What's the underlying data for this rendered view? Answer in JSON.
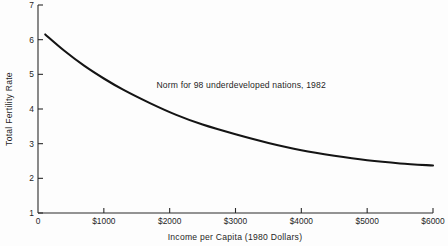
{
  "chart_data": {
    "type": "line",
    "title": "",
    "xlabel": "Income per Capita (1980 Dollars)",
    "ylabel": "Total Fertility Rate",
    "xlim": [
      0,
      6000
    ],
    "ylim": [
      1,
      7
    ],
    "grid": false,
    "legend": "none",
    "annotations": [
      {
        "text": "Norm for 98 underdeveloped nations, 1982",
        "x": 1800,
        "y": 4.62
      }
    ],
    "xticks": [
      0,
      1000,
      2000,
      3000,
      4000,
      5000,
      6000
    ],
    "xtick_labels": [
      "0",
      "$1000",
      "$2000",
      "$3000",
      "$4000",
      "$5000",
      "$6000"
    ],
    "yticks": [
      1,
      2,
      3,
      4,
      5,
      6,
      7
    ],
    "ytick_labels": [
      "1",
      "2",
      "3",
      "4",
      "5",
      "6",
      "7"
    ],
    "series": [
      {
        "name": "Norm for 98 underdeveloped nations, 1982",
        "color": "#141414",
        "x": [
          110,
          400,
          700,
          1000,
          1300,
          1700,
          2100,
          2500,
          3000,
          3500,
          4000,
          4500,
          5000,
          5500,
          6000
        ],
        "values": [
          6.15,
          5.68,
          5.25,
          4.88,
          4.55,
          4.17,
          3.83,
          3.55,
          3.27,
          3.02,
          2.81,
          2.65,
          2.52,
          2.43,
          2.37
        ]
      }
    ]
  },
  "axes": {
    "y_axis_title": "Total Fertility Rate",
    "x_axis_title": "Income per Capita (1980 Dollars)",
    "origin_label": "0"
  },
  "colors": {
    "curve": "#141414",
    "axis": "#2b2b2b",
    "background": "#fdfdfd",
    "text": "#1f1f1f"
  }
}
